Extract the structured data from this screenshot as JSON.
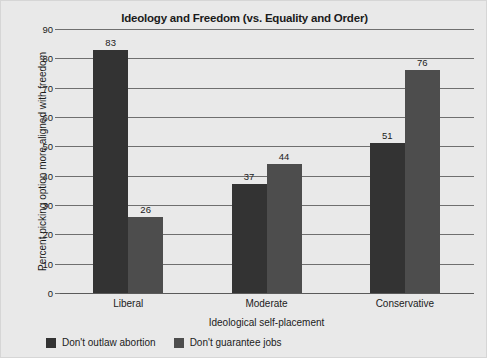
{
  "chart_data": {
    "type": "bar",
    "title": "Ideology and Freedom (vs. Equality and Order)",
    "xlabel": "Ideological self-placement",
    "ylabel": "Percent picking option more aligned with freedom",
    "categories": [
      "Liberal",
      "Moderate",
      "Conservative"
    ],
    "series": [
      {
        "name": "Don't outlaw abortion",
        "color": "#333333",
        "values": [
          83,
          37,
          51
        ]
      },
      {
        "name": "Don't guarantee jobs",
        "color": "#4d4d4d",
        "values": [
          26,
          44,
          76
        ]
      }
    ],
    "ylim": [
      0,
      90
    ],
    "ytick_step": 10,
    "yticks": [
      0,
      10,
      20,
      30,
      40,
      50,
      60,
      70,
      80,
      90
    ],
    "ytick_labels": [
      "0",
      "10",
      "20",
      "30",
      "40",
      "50",
      "60",
      "70",
      "80",
      "90"
    ],
    "grid": true,
    "grid_axis": "y",
    "legend_position": "bottom-left",
    "data_labels": true,
    "background_color": "#e9e9e9",
    "gridline_color": "#6f6f6f"
  }
}
